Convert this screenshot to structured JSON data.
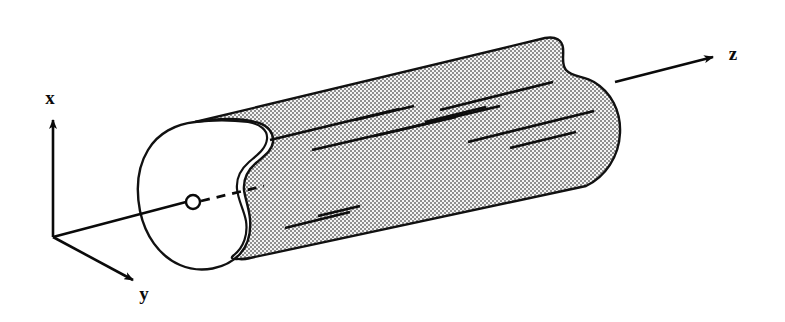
{
  "figure": {
    "background_color": "#ffffff",
    "stroke_color": "#111111",
    "fill_pattern_color": "#9a9a9a",
    "fill_pattern_background": "#f2f2f2"
  },
  "axes": {
    "origin_label": "",
    "x": {
      "label": "x",
      "label_x": 50,
      "label_y": 104,
      "from_x": 53,
      "from_y": 237,
      "to_x": 53,
      "to_y": 116
    },
    "y": {
      "label": "y",
      "label_x": 144,
      "label_y": 300,
      "from_x": 53,
      "from_y": 237,
      "to_x": 136,
      "to_y": 281
    },
    "z": {
      "label": "z",
      "label_x": 733,
      "label_y": 60,
      "from_x": 615,
      "from_y": 82,
      "to_x": 716,
      "to_y": 56
    }
  },
  "body": {
    "name": "cylinder",
    "axis_marker": {
      "name": "axis-origin-circle",
      "cx": 193,
      "cy": 202,
      "r": 7
    },
    "axis_solid_line": {
      "from_x": 53,
      "from_y": 237,
      "to_x": 186,
      "to_y": 202
    },
    "axis_dashed_line": {
      "from_x": 201,
      "from_y": 201,
      "to_x": 263,
      "to_y": 186
    },
    "left_cap_note": "kidney / bean shaped cross-section with concave notch on upper right",
    "right_cap_note": "same kidney cross-section silhouette at far end"
  },
  "slip_lines": {
    "name": "surface-slip-lines",
    "count": 11,
    "segments": [
      {
        "x1": 270,
        "y1": 140,
        "x2": 399,
        "y2": 109
      },
      {
        "x1": 355,
        "y1": 120,
        "x2": 414,
        "y2": 106
      },
      {
        "x1": 374,
        "y1": 136,
        "x2": 456,
        "y2": 117
      },
      {
        "x1": 312,
        "y1": 150,
        "x2": 399,
        "y2": 130
      },
      {
        "x1": 399,
        "y1": 130,
        "x2": 500,
        "y2": 106
      },
      {
        "x1": 440,
        "y1": 110,
        "x2": 553,
        "y2": 82
      },
      {
        "x1": 425,
        "y1": 122,
        "x2": 486,
        "y2": 107
      },
      {
        "x1": 468,
        "y1": 142,
        "x2": 594,
        "y2": 111
      },
      {
        "x1": 510,
        "y1": 148,
        "x2": 576,
        "y2": 132
      },
      {
        "x1": 285,
        "y1": 228,
        "x2": 350,
        "y2": 212
      },
      {
        "x1": 318,
        "y1": 216,
        "x2": 360,
        "y2": 206
      }
    ]
  }
}
